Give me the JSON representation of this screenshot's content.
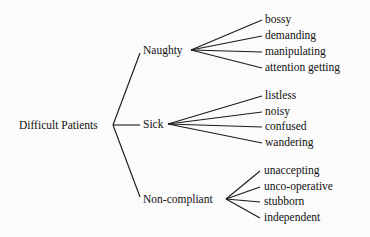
{
  "diagram": {
    "root": "Difficult Patients",
    "categories": [
      {
        "label": "Naughty",
        "items": [
          "bossy",
          "demanding",
          "manipulating",
          "attention getting"
        ]
      },
      {
        "label": "Sick",
        "items": [
          "listless",
          "noisy",
          "confused",
          "wandering"
        ]
      },
      {
        "label": "Non-compliant",
        "items": [
          "unaccepting",
          "unco-operative",
          "stubborn",
          "independent"
        ]
      }
    ]
  },
  "colors": {
    "line": "#1a1a1a",
    "text": "#111111",
    "background": "#fbfbfb"
  }
}
